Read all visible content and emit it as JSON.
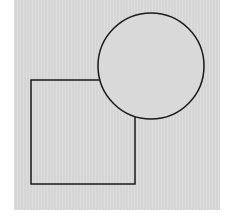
{
  "figure": {
    "background_color": "#d9d9d9",
    "stroke_color": "#1a1a1a",
    "shapes": [
      {
        "type": "square",
        "x": 31,
        "y": 80,
        "width": 104,
        "height": 104
      },
      {
        "type": "circle",
        "cx": 151,
        "cy": 66,
        "r": 53
      }
    ]
  }
}
